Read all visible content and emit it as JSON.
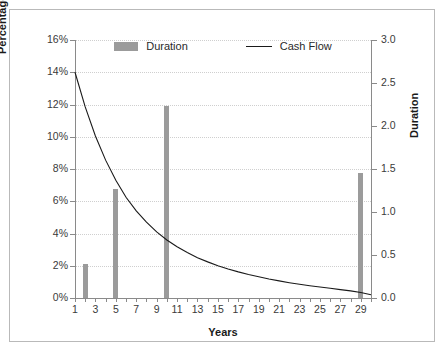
{
  "chart_data": {
    "type": "bar",
    "title": "",
    "xlabel": "Years",
    "ylabel": "Percentage of Total Cash Flow",
    "y2label": "Duration",
    "grid": true,
    "legend_position": "top-center",
    "xlim": [
      1,
      30
    ],
    "ylim": [
      0,
      16
    ],
    "y2lim": [
      0.0,
      3.0
    ],
    "ytick_labels": [
      "16%",
      "14%",
      "12%",
      "10%",
      "8%",
      "6%",
      "4%",
      "2%",
      "0%"
    ],
    "ytick_values": [
      16,
      14,
      12,
      10,
      8,
      6,
      4,
      2,
      0
    ],
    "y2tick_labels": [
      "3.0",
      "2.5",
      "2.0",
      "1.5",
      "1.0",
      "0.5",
      "0.0"
    ],
    "y2tick_values": [
      3.0,
      2.5,
      2.0,
      1.5,
      1.0,
      0.5,
      0.0
    ],
    "xtick_labels": [
      "1",
      "3",
      "5",
      "7",
      "9",
      "11",
      "13",
      "15",
      "17",
      "19",
      "21",
      "23",
      "25",
      "27",
      "29"
    ],
    "xtick_values": [
      1,
      3,
      5,
      7,
      9,
      11,
      13,
      15,
      17,
      19,
      21,
      23,
      25,
      27,
      29
    ],
    "series": [
      {
        "name": "Duration",
        "type": "bar",
        "axis": "right",
        "color": "#9b9b9b",
        "x": [
          2,
          5,
          10,
          29
        ],
        "values": [
          0.4,
          1.27,
          2.23,
          1.45
        ]
      },
      {
        "name": "Cash Flow",
        "type": "line",
        "axis": "left",
        "color": "#1a1a1a",
        "x": [
          1,
          2,
          3,
          4,
          5,
          6,
          7,
          8,
          9,
          10,
          11,
          12,
          13,
          14,
          15,
          16,
          17,
          18,
          19,
          20,
          21,
          22,
          23,
          24,
          25,
          26,
          27,
          28,
          29,
          30
        ],
        "values": [
          14.0,
          11.85,
          10.05,
          8.55,
          7.3,
          6.25,
          5.4,
          4.7,
          4.1,
          3.6,
          3.18,
          2.82,
          2.5,
          2.24,
          2.0,
          1.8,
          1.62,
          1.46,
          1.32,
          1.18,
          1.06,
          0.95,
          0.85,
          0.76,
          0.68,
          0.6,
          0.52,
          0.44,
          0.34,
          0.2
        ]
      }
    ]
  },
  "legend": {
    "items": [
      {
        "label": "Duration",
        "marker": "bar-swatch",
        "color": "#9b9b9b"
      },
      {
        "label": "Cash Flow",
        "marker": "line-swatch",
        "color": "#1a1a1a"
      }
    ]
  },
  "axis_titles": {
    "left": "Percentage of Total Cash Flow",
    "right": "Duration",
    "bottom": "Years"
  }
}
